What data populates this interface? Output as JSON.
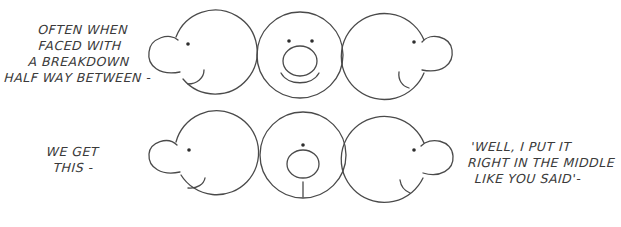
{
  "captions": {
    "top_left": [
      "Often when",
      "faced with",
      "a breakdown",
      "half way between -"
    ],
    "bottom_left": [
      "We get",
      "this -"
    ],
    "bottom_right": [
      "'Well, I put it",
      "right in the middle",
      "like you said'-"
    ]
  },
  "figures": {
    "top_row": {
      "description": "Correct in-between: profile left, front view, profile right",
      "heads": [
        {
          "view": "profile-left",
          "cx": 215,
          "cy": 53,
          "r": 42,
          "nose": {
            "cx": 164,
            "cy": 58,
            "r": 16
          },
          "eye": {
            "cx": 188,
            "cy": 44
          }
        },
        {
          "view": "front",
          "cx": 300,
          "cy": 55,
          "r": 43,
          "nose": {
            "cx": 300,
            "cy": 62,
            "rx": 17,
            "ry": 15
          },
          "eyes": [
            {
              "cx": 289,
              "cy": 41
            },
            {
              "cx": 312,
              "cy": 41
            }
          ]
        },
        {
          "view": "profile-right",
          "cx": 386,
          "cy": 55,
          "r": 43,
          "nose": {
            "cx": 437,
            "cy": 56,
            "r": 16
          },
          "eye": {
            "cx": 414,
            "cy": 42
          }
        }
      ]
    },
    "bottom_row": {
      "description": "Wrong in-between: front view has single centred eye and mouth line",
      "heads": [
        {
          "view": "profile-left",
          "cx": 215,
          "cy": 157,
          "r": 42,
          "nose": {
            "cx": 164,
            "cy": 160,
            "r": 16
          },
          "eye": {
            "cx": 189,
            "cy": 150
          }
        },
        {
          "view": "front-wrong",
          "cx": 300,
          "cy": 157,
          "r": 43,
          "nose": {
            "cx": 300,
            "cy": 164,
            "rx": 16,
            "ry": 14
          },
          "eye": {
            "cx": 303,
            "cy": 145
          }
        },
        {
          "view": "profile-right",
          "cx": 386,
          "cy": 157,
          "r": 43,
          "nose": {
            "cx": 437,
            "cy": 158,
            "r": 16
          },
          "eye": {
            "cx": 414,
            "cy": 150
          }
        }
      ]
    }
  }
}
